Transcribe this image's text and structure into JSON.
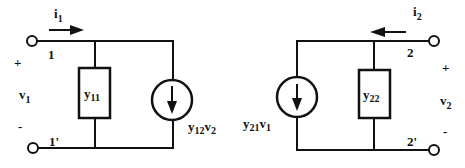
{
  "diagram": {
    "type": "two-port y-parameter equivalent circuit",
    "left_port": {
      "current": {
        "symbol": "i",
        "sub": "1",
        "direction": "right"
      },
      "terminal_top": "1",
      "terminal_bottom": "1'",
      "voltage": {
        "symbol": "v",
        "sub": "1",
        "plus": "+",
        "minus": "-"
      },
      "admittance": {
        "symbol": "y",
        "sub": "11"
      },
      "source": {
        "coef": "y",
        "coef_sub": "12",
        "var": "v",
        "var_sub": "2",
        "arrow": "down"
      }
    },
    "right_port": {
      "current": {
        "symbol": "i",
        "sub": "2",
        "direction": "left"
      },
      "terminal_top": "2",
      "terminal_bottom": "2'",
      "voltage": {
        "symbol": "v",
        "sub": "2",
        "plus": "+",
        "minus": "-"
      },
      "admittance": {
        "symbol": "y",
        "sub": "22"
      },
      "source": {
        "coef": "y",
        "coef_sub": "21",
        "var": "v",
        "var_sub": "1",
        "arrow": "down"
      }
    },
    "colors": {
      "line": "#111111",
      "background": "#ffffff"
    }
  }
}
